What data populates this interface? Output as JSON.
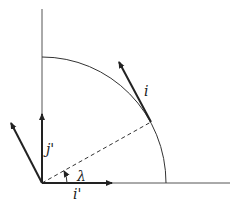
{
  "diagram": {
    "labels": {
      "tangent_vector": "i",
      "vertical_vector": "j'",
      "horizontal_vector": "i'",
      "angle": "λ"
    },
    "colors": {
      "stroke": "#222222",
      "axis": "#555555"
    }
  }
}
